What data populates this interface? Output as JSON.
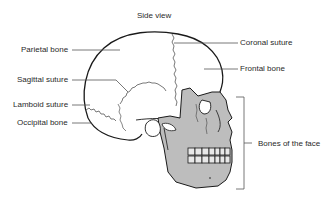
{
  "diagram": {
    "title": "Side view",
    "labels_left": [
      {
        "id": "parietal",
        "text": "Parietal bone"
      },
      {
        "id": "sagittal",
        "text": "Sagittal suture"
      },
      {
        "id": "lamboid",
        "text": "Lamboid suture"
      },
      {
        "id": "occipital",
        "text": "Occipital bone"
      }
    ],
    "labels_right": [
      {
        "id": "coronal",
        "text": "Coronal suture"
      },
      {
        "id": "frontal",
        "text": "Frontal bone"
      },
      {
        "id": "face",
        "text": "Bones of the face"
      }
    ],
    "colors": {
      "outline": "#1a1a1a",
      "face_fill": "#bdbdbd",
      "leader": "#555555",
      "background": "#ffffff"
    }
  }
}
